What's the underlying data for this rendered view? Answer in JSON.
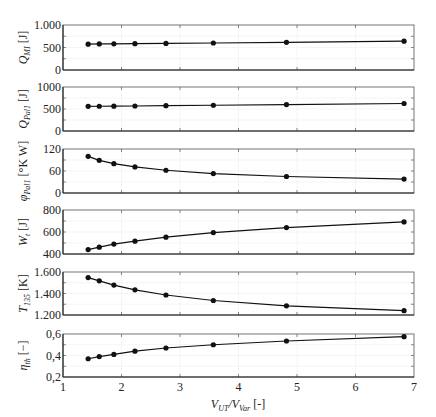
{
  "chart_data": {
    "type": "line",
    "xlabel": "V_UT/V_Var [-]",
    "xlabel_parts": {
      "main1": "V",
      "sub1": "UT",
      "sep": "/",
      "main2": "V",
      "sub2": "Var",
      "unit": " [-]"
    },
    "xlim": [
      1,
      7
    ],
    "xticks": [
      1,
      2,
      3,
      4,
      5,
      6,
      7
    ],
    "x": [
      1.43,
      1.62,
      1.87,
      2.23,
      2.76,
      3.57,
      4.82,
      6.83
    ],
    "grid": true,
    "panels": [
      {
        "name": "Q_MI",
        "label_main": "Q",
        "label_sub": "MI",
        "unit": "[J]",
        "ylim": [
          0,
          1000
        ],
        "yticks": [
          0,
          500,
          1000
        ],
        "ytick_labels": [
          "0",
          "500",
          "1.000"
        ],
        "values": [
          575,
          580,
          582,
          585,
          590,
          600,
          615,
          640
        ]
      },
      {
        "name": "Q_Pal1",
        "label_main": "Q",
        "label_sub": "Pal1",
        "unit": "[J]",
        "ylim": [
          0,
          1000
        ],
        "yticks": [
          0,
          500,
          1000
        ],
        "ytick_labels": [
          "0",
          "500",
          "1000"
        ],
        "values": [
          560,
          562,
          565,
          568,
          575,
          585,
          600,
          625
        ]
      },
      {
        "name": "phi_Pal1",
        "label_main": "φ",
        "label_sub": "Pal1",
        "unit": "[°K W]",
        "ylim": [
          0,
          120
        ],
        "yticks": [
          0,
          60,
          120
        ],
        "ytick_labels": [
          "0",
          "60",
          "120"
        ],
        "values": [
          100,
          89,
          80,
          71,
          62,
          53,
          45,
          38
        ]
      },
      {
        "name": "W_t",
        "label_main": "W",
        "label_sub": "t",
        "unit": "[J]",
        "ylim": [
          400,
          800
        ],
        "yticks": [
          400,
          600,
          800
        ],
        "ytick_labels": [
          "400",
          "600",
          "800"
        ],
        "values": [
          440,
          462,
          490,
          517,
          553,
          595,
          640,
          692
        ]
      },
      {
        "name": "T_135",
        "label_main": "T",
        "label_sub": "135",
        "unit": "[K]",
        "ylim": [
          1200,
          1600
        ],
        "yticks": [
          1200,
          1400,
          1600
        ],
        "ytick_labels": [
          "1.200",
          "1.400",
          "1.600"
        ],
        "values": [
          1548,
          1518,
          1478,
          1434,
          1386,
          1335,
          1285,
          1240
        ]
      },
      {
        "name": "eta_th",
        "label_main": "η",
        "label_sub": "th",
        "unit": "[−]",
        "ylim": [
          0.2,
          0.6
        ],
        "yticks": [
          0.2,
          0.4,
          0.6
        ],
        "ytick_labels": [
          "0,2",
          "0,4",
          "0,6"
        ],
        "values": [
          0.37,
          0.39,
          0.41,
          0.44,
          0.47,
          0.5,
          0.535,
          0.575
        ]
      }
    ]
  }
}
